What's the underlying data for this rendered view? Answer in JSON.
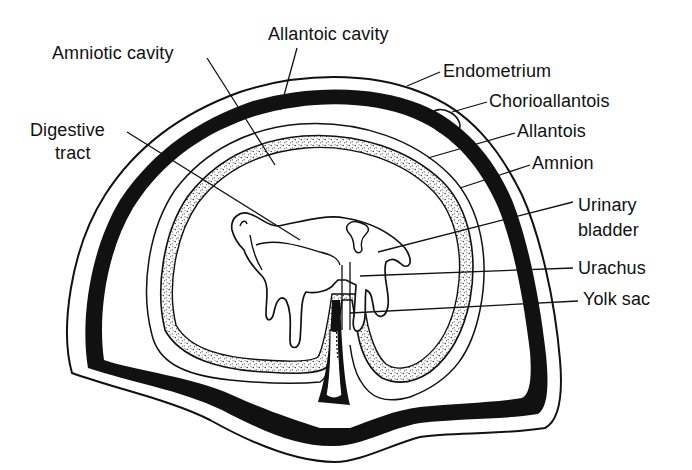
{
  "diagram": {
    "colors": {
      "ink": "#111111",
      "background": "#ffffff",
      "stipple": "#222222"
    },
    "labels": [
      {
        "id": "amniotic-cavity",
        "text": "Amniotic cavity",
        "x": 52,
        "y": 43
      },
      {
        "id": "allantoic-cavity",
        "text": "Allantoic cavity",
        "x": 268,
        "y": 24
      },
      {
        "id": "endometrium",
        "text": "Endometrium",
        "x": 443,
        "y": 61
      },
      {
        "id": "chorioallantois",
        "text": "Chorioallantois",
        "x": 489,
        "y": 91
      },
      {
        "id": "allantois",
        "text": "Allantois",
        "x": 517,
        "y": 121
      },
      {
        "id": "amnion",
        "text": "Amnion",
        "x": 532,
        "y": 153
      },
      {
        "id": "digestive-tract-line1",
        "text": "Digestive",
        "x": 30,
        "y": 120
      },
      {
        "id": "digestive-tract-line2",
        "text": "tract",
        "x": 55,
        "y": 143
      },
      {
        "id": "urinary-bladder-line1",
        "text": "Urinary",
        "x": 578,
        "y": 195
      },
      {
        "id": "urinary-bladder-line2",
        "text": "bladder",
        "x": 578,
        "y": 220
      },
      {
        "id": "urachus",
        "text": "Urachus",
        "x": 578,
        "y": 258
      },
      {
        "id": "yolk-sac",
        "text": "Yolk sac",
        "x": 583,
        "y": 289
      }
    ],
    "structures": [
      "endometrium",
      "chorioallantois",
      "allantoic cavity",
      "allantois",
      "amnion",
      "amniotic cavity",
      "fetus",
      "digestive tract",
      "urinary bladder",
      "urachus",
      "yolk sac",
      "umbilical cord"
    ]
  }
}
